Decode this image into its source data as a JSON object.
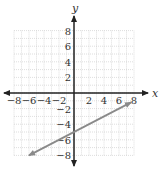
{
  "chart_data": {
    "type": "line",
    "title": "",
    "xlabel": "x",
    "ylabel": "y",
    "xlim": [
      -8,
      8
    ],
    "ylim": [
      -8,
      8
    ],
    "grid": true,
    "grid_minor_step": 1,
    "x_ticks": [
      -8,
      -6,
      -4,
      -2,
      2,
      4,
      6,
      8
    ],
    "y_ticks": [
      8,
      6,
      4,
      2,
      -2,
      -4,
      -6,
      -8
    ],
    "series": [
      {
        "name": "line",
        "equation": "y = 0.5x - 5",
        "slope": 0.5,
        "y_intercept": -5,
        "x": [
          -6,
          7.6
        ],
        "y": [
          -8,
          -1.2
        ],
        "arrows": "both",
        "color": "#8a8a8a"
      }
    ]
  },
  "colors": {
    "grid": "#c8c8c8",
    "axis": "#222222",
    "line": "#8a8a8a"
  }
}
